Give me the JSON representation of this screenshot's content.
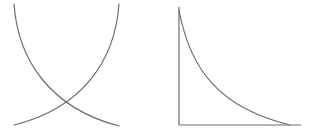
{
  "colors": {
    "background": "#ffffff",
    "stroke": "#6e6e6e"
  },
  "diagrams": [
    {
      "id": "crossing-curves",
      "description": "Two convex curves crossing near the bottom",
      "curves": [
        {
          "name": "falling-curve",
          "from": [
            14,
            4
          ],
          "to": [
            119,
            126
          ]
        },
        {
          "name": "rising-curve",
          "from": [
            119,
            4
          ],
          "to": [
            14,
            125
          ]
        }
      ],
      "intersection": [
        66,
        109
      ],
      "axes": false
    },
    {
      "id": "decay-curve-with-axes",
      "description": "Decreasing convex curve between y-axis and x-axis",
      "axes": true,
      "y_axis": {
        "x": 179,
        "from_y": 7,
        "to_y": 125
      },
      "x_axis": {
        "y": 125,
        "from_x": 179,
        "to_x": 301
      },
      "curve": {
        "name": "decay-curve",
        "from": [
          179,
          10
        ],
        "to": [
          290,
          125
        ]
      }
    }
  ]
}
